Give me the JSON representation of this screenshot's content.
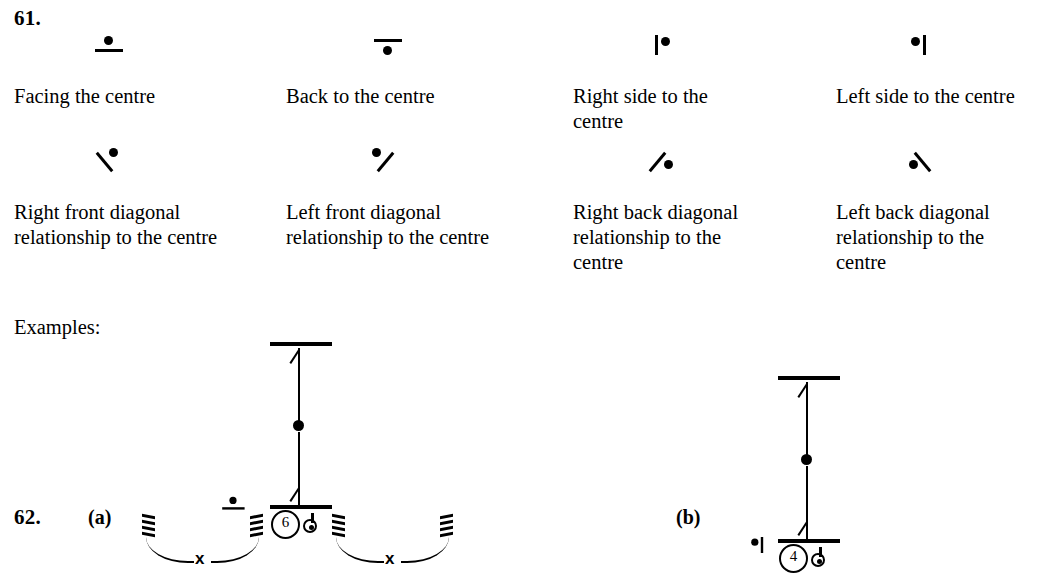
{
  "page": {
    "sections": [
      {
        "number": "61."
      },
      {
        "number": "62."
      }
    ],
    "examples_label": "Examples:"
  },
  "symbol_table": {
    "row1": [
      {
        "icon": "facing-centre-symbol",
        "label": "Facing the centre"
      },
      {
        "icon": "back-to-centre-symbol",
        "label": "Back to the centre"
      },
      {
        "icon": "right-side-to-centre-symbol",
        "label": "Right side to the centre"
      },
      {
        "icon": "left-side-to-centre-symbol",
        "label": "Left side to the centre"
      }
    ],
    "row2": [
      {
        "icon": "right-front-diagonal-symbol",
        "label": "Right front diagonal relationship to the centre"
      },
      {
        "icon": "left-front-diagonal-symbol",
        "label": "Left front diagonal relationship to the centre"
      },
      {
        "icon": "right-back-diagonal-symbol",
        "label": "Right back diagonal relationship to the centre"
      },
      {
        "icon": "left-back-diagonal-symbol",
        "label": "Left back diagonal relationship to the centre"
      }
    ]
  },
  "examples": {
    "a": {
      "part_label": "(a)",
      "dancer_number": "6",
      "orientation_icon": "facing-centre-symbol",
      "hooks": [
        {
          "x_mark": "x"
        },
        {
          "x_mark": "x"
        }
      ]
    },
    "b": {
      "part_label": "(b)",
      "dancer_number": "4",
      "orientation_icon": "left-side-to-centre-symbol"
    }
  },
  "colors": {
    "ink": "#000000",
    "paper": "#ffffff"
  }
}
